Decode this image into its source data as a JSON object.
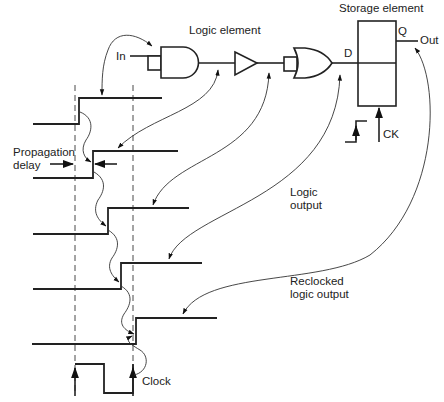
{
  "diagram": {
    "type": "logic-timing-diagram",
    "labels": {
      "logic_element": "Logic element",
      "storage_element": "Storage element",
      "input": "In",
      "d_pin": "D",
      "q_pin": "Q",
      "output": "Out",
      "clock_pin": "CK",
      "propagation_delay_line1": "Propagation",
      "propagation_delay_line2": "delay",
      "logic_output_line1": "Logic",
      "logic_output_line2": "output",
      "reclocked_line1": "Reclocked",
      "reclocked_line2": "logic output",
      "clock": "Clock"
    },
    "components": [
      {
        "id": "input-box",
        "kind": "buffer-box"
      },
      {
        "id": "and-gate",
        "kind": "AND gate"
      },
      {
        "id": "buffer",
        "kind": "buffer (triangle)"
      },
      {
        "id": "or-box",
        "kind": "buffer-box"
      },
      {
        "id": "or-gate",
        "kind": "OR gate"
      },
      {
        "id": "storage-element",
        "kind": "D flip-flop",
        "pins": [
          "D",
          "Q",
          "CK"
        ]
      }
    ],
    "waveforms": [
      {
        "name": "input",
        "low_y": 124,
        "high_y": 98,
        "edge_x": 79
      },
      {
        "name": "after-and",
        "low_y": 178,
        "high_y": 151,
        "edge_x": 93
      },
      {
        "name": "after-buffer",
        "low_y": 234,
        "high_y": 208,
        "edge_x": 108
      },
      {
        "name": "logic-output",
        "low_y": 289,
        "high_y": 263,
        "edge_x": 121
      },
      {
        "name": "reclocked-output",
        "low_y": 344,
        "high_y": 318,
        "edge_x": 136
      }
    ],
    "clock_edges_x": [
      75,
      133
    ],
    "colors": {
      "line": "#222222",
      "background": "#ffffff"
    }
  }
}
